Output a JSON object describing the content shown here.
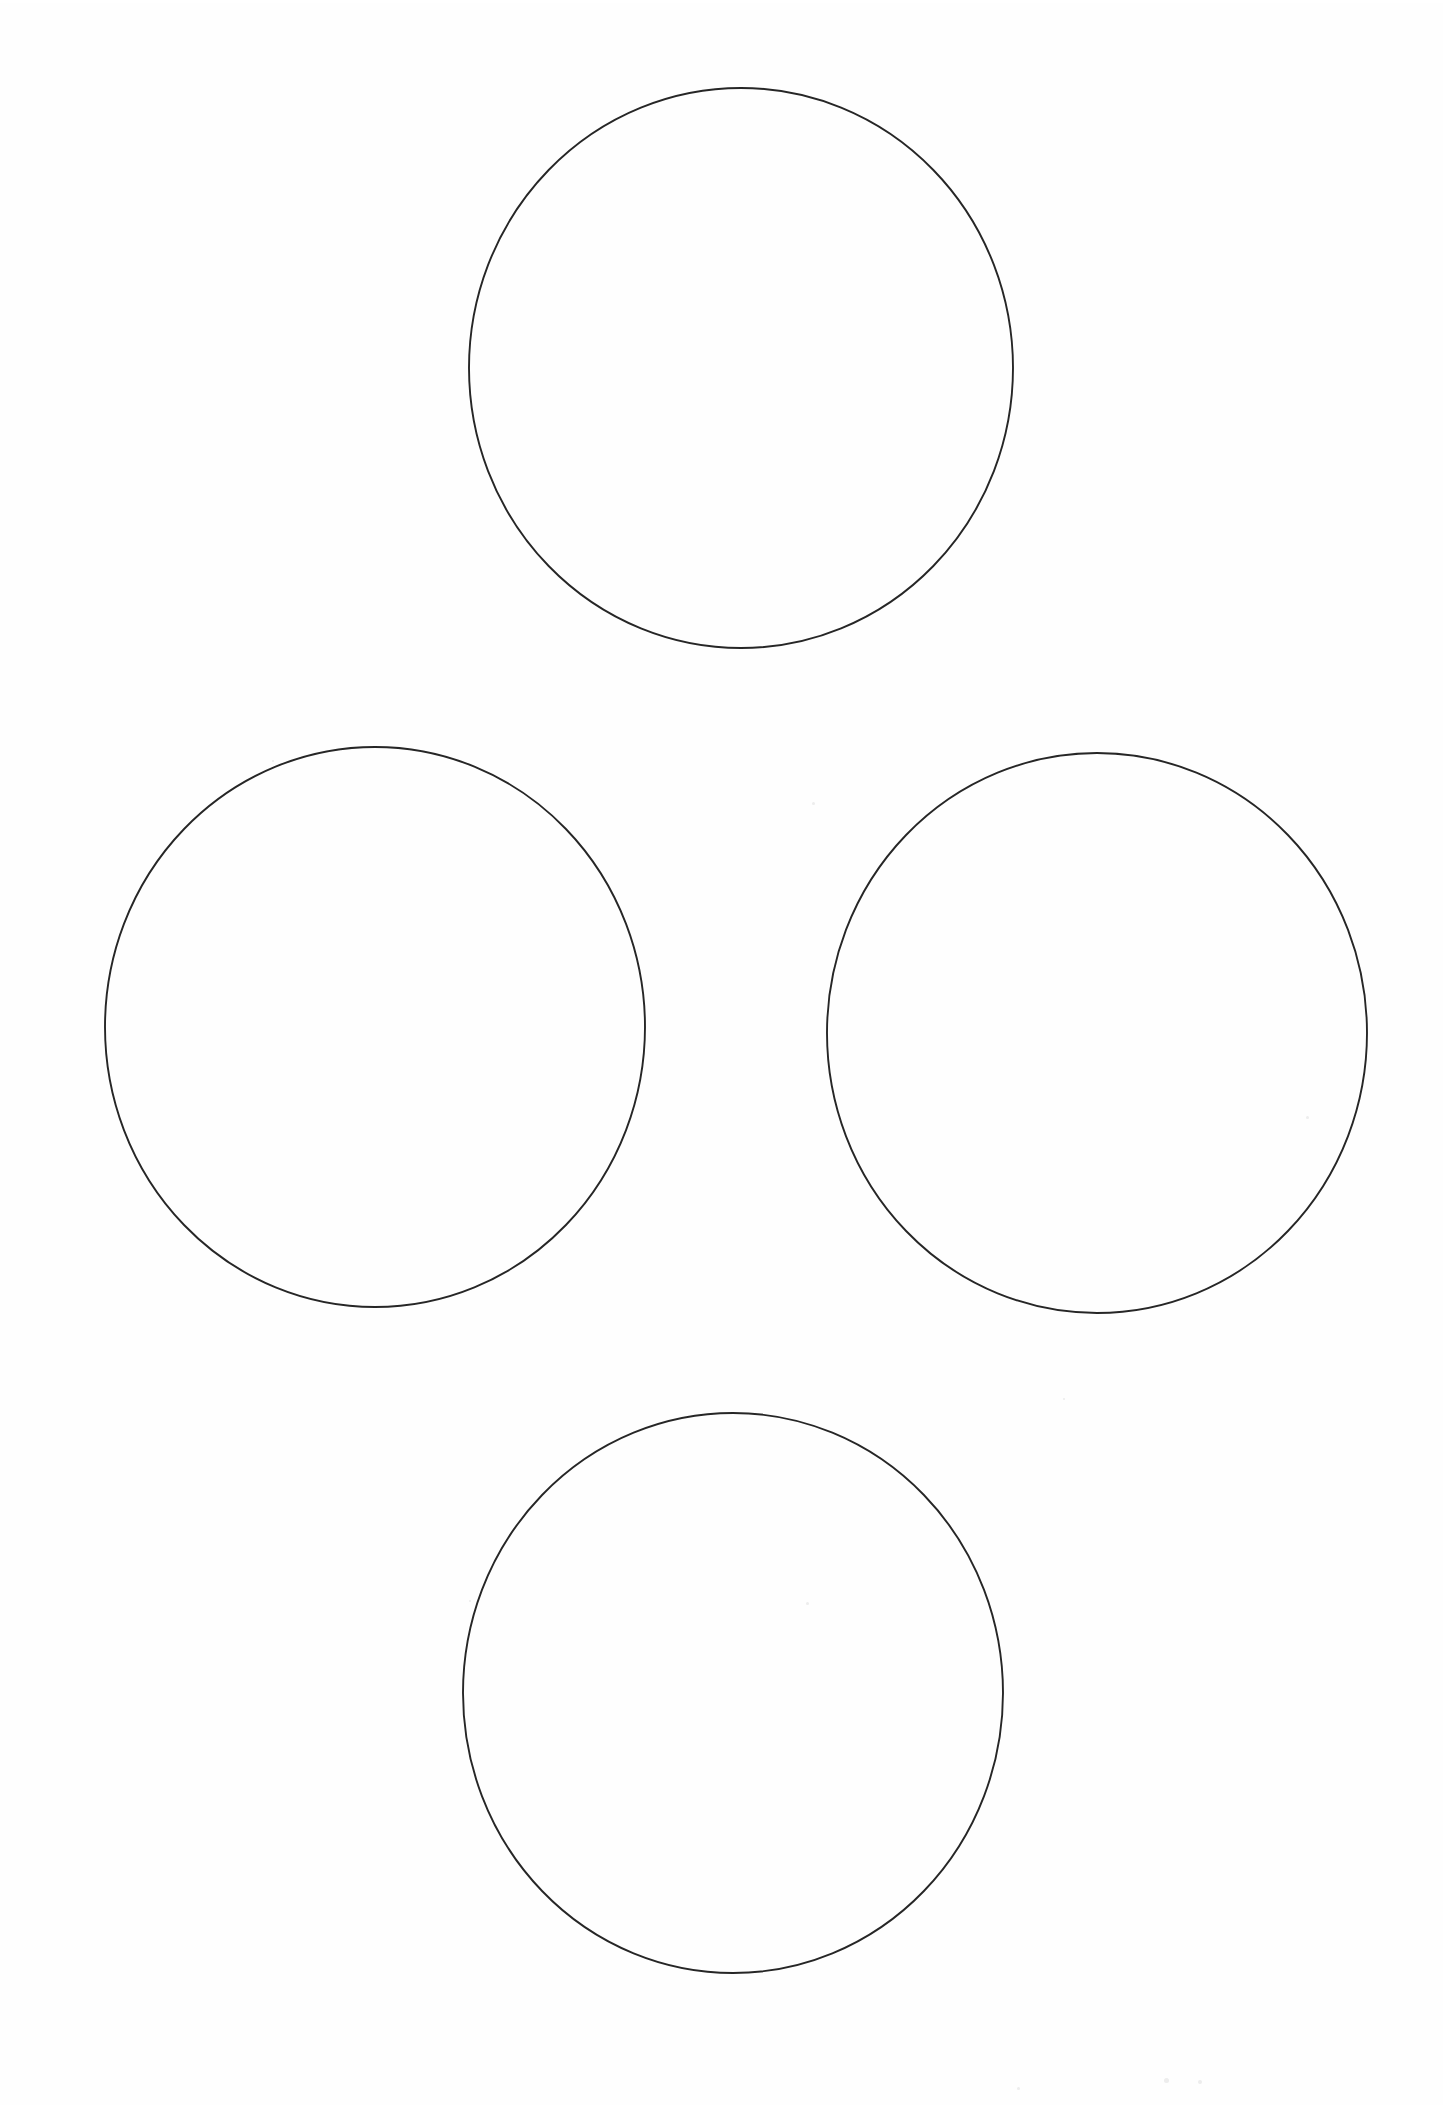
{
  "document": {
    "title": "Four Circles Worksheet",
    "page_width": 1445,
    "page_height": 2105,
    "background_color": "#ffffff",
    "paper_tint": "#fefefe",
    "medium": "scanned white paper sheet",
    "visible_text": "",
    "text_present": false
  },
  "figure": {
    "name": "four-circle-diamond-arrangement",
    "shape_count": 4,
    "stroke_color": "#262626",
    "stroke_width": 1.9,
    "fill": "none",
    "layout": "diamond",
    "circles": [
      {
        "id": "circle-top",
        "position_label": "top",
        "cx": 741,
        "cy": 368,
        "rx": 272,
        "ry": 280,
        "bbox_left": 469,
        "bbox_right": 1013,
        "bbox_top": 88,
        "bbox_bottom": 648,
        "label": ""
      },
      {
        "id": "circle-left",
        "position_label": "left",
        "cx": 375,
        "cy": 1027,
        "rx": 270,
        "ry": 280,
        "bbox_left": 105,
        "bbox_right": 645,
        "bbox_top": 747,
        "bbox_bottom": 1307,
        "label": ""
      },
      {
        "id": "circle-right",
        "position_label": "right",
        "cx": 1097,
        "cy": 1033,
        "rx": 270,
        "ry": 280,
        "bbox_left": 827,
        "bbox_right": 1367,
        "bbox_top": 753,
        "bbox_bottom": 1313,
        "label": ""
      },
      {
        "id": "circle-bottom",
        "position_label": "bottom",
        "cx": 733,
        "cy": 1693,
        "rx": 270,
        "ry": 280,
        "bbox_left": 463,
        "bbox_right": 1003,
        "bbox_top": 1413,
        "bbox_bottom": 1973,
        "label": ""
      }
    ]
  },
  "artifacts": {
    "specks": [
      {
        "x": 812,
        "y": 802,
        "size": 3
      },
      {
        "x": 1306,
        "y": 1116,
        "size": 3
      },
      {
        "x": 806,
        "y": 1602,
        "size": 3
      },
      {
        "x": 469,
        "y": 1600,
        "size": 2
      },
      {
        "x": 1063,
        "y": 1398,
        "size": 2
      },
      {
        "x": 272,
        "y": 760,
        "size": 2
      },
      {
        "x": 1164,
        "y": 2078,
        "size": 5
      },
      {
        "x": 1198,
        "y": 2080,
        "size": 4
      },
      {
        "x": 1017,
        "y": 2087,
        "size": 3
      }
    ]
  }
}
